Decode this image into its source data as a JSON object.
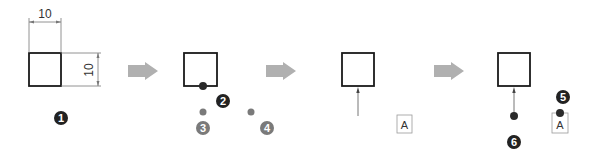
{
  "diagram": {
    "type": "step-sequence",
    "colors": {
      "outline": "#1a1a1a",
      "dimension_line": "#777777",
      "step_arrow": "#b0b0b0",
      "badge_dark": "#222222",
      "badge_gray": "#7a7a7a",
      "dot_dark": "#2a2a2a",
      "dot_gray": "#7a7a7a",
      "label_box_border": "#999999"
    },
    "steps": [
      {
        "id": "step-1",
        "square": {
          "x": 29,
          "y": 53,
          "w": 32,
          "h": 33
        },
        "dimensions": {
          "width_label": "10",
          "height_label": "10"
        },
        "badge": {
          "label": "1",
          "x": 61,
          "y": 118,
          "style": "dark"
        }
      },
      {
        "id": "step-2",
        "square": {
          "x": 184,
          "y": 53,
          "w": 33,
          "h": 33
        },
        "dot_on_square": {
          "x": 203,
          "y": 86
        },
        "badge": {
          "label": "2",
          "x": 223,
          "y": 101,
          "style": "dark"
        },
        "options": [
          {
            "dot": {
              "x": 203,
              "y": 112
            },
            "badge": {
              "label": "3",
              "x": 203,
              "y": 128,
              "style": "gray"
            }
          },
          {
            "dot": {
              "x": 251,
              "y": 112
            },
            "badge": {
              "label": "4",
              "x": 267,
              "y": 128,
              "style": "gray"
            }
          }
        ]
      },
      {
        "id": "step-3",
        "square": {
          "x": 342,
          "y": 53,
          "w": 32,
          "h": 33
        },
        "leader_arrow": {
          "x": 358,
          "y_from": 116,
          "y_to": 86
        },
        "label_box": {
          "text": "A",
          "x": 397,
          "y": 115,
          "w": 15,
          "h": 18
        }
      },
      {
        "id": "step-4",
        "square": {
          "x": 498,
          "y": 53,
          "w": 32,
          "h": 33
        },
        "leader_arrow": {
          "x": 514,
          "y_from": 116,
          "y_to": 86
        },
        "leader_dot": {
          "x": 514,
          "y": 116
        },
        "badge_leader": {
          "label": "6",
          "x": 514,
          "y": 142,
          "style": "dark"
        },
        "label_box": {
          "text": "A",
          "x": 552,
          "y": 113,
          "w": 16,
          "h": 20
        },
        "label_box_dot": {
          "x": 560,
          "y": 113
        },
        "badge_box": {
          "label": "5",
          "x": 563,
          "y": 97,
          "style": "dark"
        }
      }
    ],
    "step_arrows": [
      {
        "x": 128,
        "y": 71
      },
      {
        "x": 266,
        "y": 71
      },
      {
        "x": 434,
        "y": 71
      }
    ]
  }
}
